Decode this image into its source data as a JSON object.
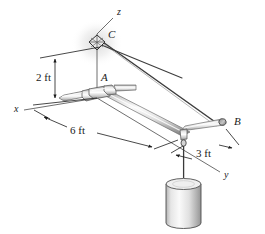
{
  "figure": {
    "background_color": "#ffffff",
    "ink_color": "#1a1a1a",
    "metal_light": "#f2f2f2",
    "metal_mid": "#c9c9c9",
    "metal_dark": "#8a8a8a",
    "metal_edge": "#4d4d4d"
  },
  "axes": [
    {
      "name": "z-axis",
      "label": "z",
      "x": 117,
      "y": 12
    },
    {
      "name": "x-axis",
      "label": "x",
      "x": 14,
      "y": 109
    },
    {
      "name": "y-axis",
      "label": "y",
      "x": 224,
      "y": 175
    }
  ],
  "points": [
    {
      "name": "point-c",
      "label": "C",
      "x": 108,
      "y": 34
    },
    {
      "name": "point-a",
      "label": "A",
      "x": 101,
      "y": 78
    },
    {
      "name": "point-b",
      "label": "B",
      "x": 234,
      "y": 122
    }
  ],
  "dimensions": [
    {
      "name": "dimension-2ft",
      "label": "2 ft",
      "x": 36,
      "y": 78,
      "orientation": "vertical"
    },
    {
      "name": "dimension-6ft",
      "label": "6 ft",
      "x": 72,
      "y": 130,
      "orientation": "diagonal"
    },
    {
      "name": "dimension-3ft",
      "label": "3 ft",
      "x": 200,
      "y": 153,
      "orientation": "diagonal"
    }
  ],
  "components": [
    {
      "name": "support-bracket-c",
      "type": "fixed-square-support"
    },
    {
      "name": "bearing-collar-a",
      "type": "journal-bearing"
    },
    {
      "name": "boom-rod-main",
      "type": "cylindrical-rod"
    },
    {
      "name": "cross-rod-b",
      "type": "cylindrical-rod"
    },
    {
      "name": "cable-c-to-b",
      "type": "cable"
    },
    {
      "name": "cable-c-to-boom",
      "type": "cable"
    },
    {
      "name": "hook-eyelet",
      "type": "eye-hook"
    },
    {
      "name": "suspended-weight",
      "type": "cylinder-weight"
    }
  ]
}
